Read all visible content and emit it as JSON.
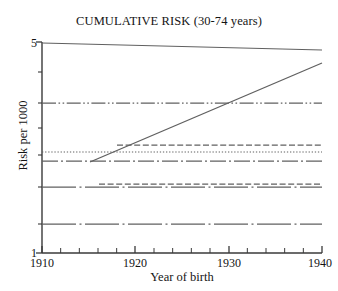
{
  "chart_data": {
    "type": "line",
    "title": "CUMULATIVE RISK (30-74 years)",
    "xlabel": "Year of birth",
    "ylabel": "Risk per 1000",
    "xlim": [
      1910,
      1940
    ],
    "ylim": [
      1,
      5
    ],
    "yscale": "log",
    "grid": false,
    "legend": "none",
    "x_tick_labels": [
      "1910",
      "1920",
      "1930",
      "1940"
    ],
    "x_tick_values": [
      1910,
      1920,
      1930,
      1940
    ],
    "x_minor_tick_step": 2,
    "y_tick_labels": [
      "5",
      "1"
    ],
    "y_tick_values": [
      5,
      1
    ],
    "y_minor_tick_values": [
      4.3,
      3.7,
      3.2,
      2.3,
      1.85,
      1.35
    ],
    "series": [
      {
        "name": "upper-solid-declining",
        "style": "solid",
        "x": [
          1910,
          1940
        ],
        "values": [
          4.98,
          4.68
        ]
      },
      {
        "name": "rising-solid",
        "style": "solid",
        "x": [
          1914,
          1940
        ],
        "values": [
          2.12,
          4.32
        ]
      },
      {
        "name": "flat-dash-dot-dot-upper",
        "style": "dash-dot-dot",
        "x": [
          1910,
          1940
        ],
        "values": [
          3.21,
          3.21
        ]
      },
      {
        "name": "flat-dashed-mid",
        "style": "dashed",
        "x": [
          1918,
          1940
        ],
        "values": [
          2.42,
          2.42
        ]
      },
      {
        "name": "flat-dotted-mid",
        "style": "dotted",
        "x": [
          1910,
          1940
        ],
        "values": [
          2.31,
          2.31
        ]
      },
      {
        "name": "flat-dash-dot-mid",
        "style": "dash-dot",
        "x": [
          1910,
          1940
        ],
        "values": [
          2.16,
          2.16
        ]
      },
      {
        "name": "flat-dashed-lower",
        "style": "dashed",
        "x": [
          1916,
          1940
        ],
        "values": [
          1.88,
          1.88
        ]
      },
      {
        "name": "flat-dash-dot-lower",
        "style": "dash-dot",
        "x": [
          1910,
          1940
        ],
        "values": [
          1.84,
          1.84
        ]
      },
      {
        "name": "flat-dash-dot-bottom",
        "style": "dash-dot",
        "x": [
          1910,
          1940
        ],
        "values": [
          1.36,
          1.36
        ]
      }
    ]
  },
  "colors": {
    "axis": "#3a3a3a",
    "line": "#606060",
    "text": "#141414",
    "background": "#ffffff"
  }
}
